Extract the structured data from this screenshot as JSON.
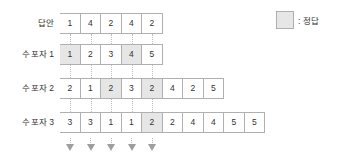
{
  "legend": {
    "swatch_name": "correct-answer-swatch",
    "text": ": 정답",
    "swatch_color": "#e6e6e6",
    "border_color": "#b0b0b0"
  },
  "rows": [
    {
      "label": "답안",
      "values": [
        "1",
        "4",
        "2",
        "4",
        "2"
      ],
      "correct_indices": []
    },
    {
      "label": "수포자 1",
      "values": [
        "1",
        "2",
        "3",
        "4",
        "5"
      ],
      "correct_indices": [
        0,
        3
      ]
    },
    {
      "label": "수포자 2",
      "values": [
        "2",
        "1",
        "2",
        "3",
        "2",
        "4",
        "2",
        "5"
      ],
      "correct_indices": [
        2,
        4
      ]
    },
    {
      "label": "수포자 3",
      "values": [
        "3",
        "3",
        "1",
        "1",
        "2",
        "2",
        "4",
        "4",
        "5",
        "5"
      ],
      "correct_indices": [
        4
      ]
    }
  ],
  "arrows": {
    "count": 5,
    "icon": "arrow-down-icon",
    "color": "#9e9e9e"
  },
  "connectors": {
    "count": 5,
    "color": "#bdbdbd",
    "style": "dotted"
  }
}
